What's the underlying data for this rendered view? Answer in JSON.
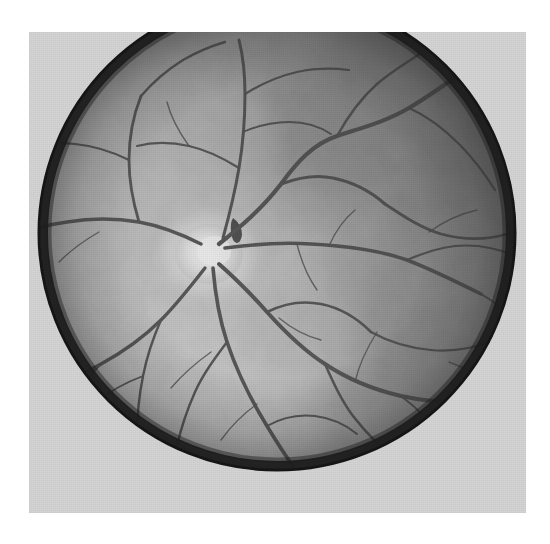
{
  "document": {
    "type": "medical-photograph",
    "modality": "Retinal fundus photography",
    "rendering": "grayscale halftone print",
    "caption": "",
    "page_background": "#ffffff"
  },
  "photo": {
    "name": "fundus-photograph",
    "frame": {
      "x": 29,
      "y": 32,
      "width": 497,
      "height": 481
    },
    "paper_color": "#d5d5d5",
    "has_border_text": false,
    "labels": [],
    "annotations": []
  },
  "fundus": {
    "shape": "near-circular, slightly squared at the superior margin",
    "center": {
      "x": 248,
      "y": 233
    },
    "radius_x": 236,
    "radius_y": 235,
    "rim_color": "#1d1d1d",
    "rim_width_px": 7,
    "clipped_edges": [
      "top"
    ],
    "illumination": {
      "bright_region": "inferior-nasal / lower-left",
      "dark_region": "superior-temporal / upper-right",
      "bright_color": "#c9c9c9",
      "mid_color": "#9e9e9e",
      "dark_color": "#4f4f4f"
    }
  },
  "optic_disc": {
    "name": "optic-disc",
    "center": {
      "x": 180,
      "y": 222
    },
    "radius_x": 34,
    "radius_y": 30,
    "color": "#e2e2e2",
    "cup_color": "#efefef",
    "description": "bright pale disc, left of centre, source of the vascular arcades"
  },
  "vascular_tree": {
    "vessel_color": "#3a3a3a",
    "branch_count": 4,
    "arcades": [
      {
        "name": "superior-temporal-arcade",
        "direction": "up and right"
      },
      {
        "name": "inferior-temporal-arcade",
        "direction": "down and right"
      },
      {
        "name": "superior-nasal-arcade",
        "direction": "up and left"
      },
      {
        "name": "inferior-nasal-arcade",
        "direction": "down and left"
      }
    ]
  },
  "texture": {
    "type": "mottled choroidal / halftone grain",
    "grain_scale_px": 3,
    "contrast": "medium"
  },
  "colors": {
    "page_white": "#ffffff",
    "paper_gray": "#d5d5d5",
    "rim_dark": "#1d1d1d",
    "retina_bright": "#c9c9c9",
    "retina_mid": "#9e9e9e",
    "retina_dark": "#4f4f4f",
    "vessel": "#3a3a3a",
    "disc": "#e2e2e2"
  }
}
